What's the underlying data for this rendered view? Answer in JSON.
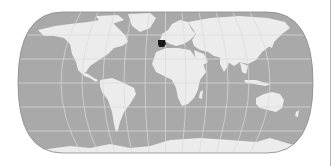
{
  "map": {
    "projection": "pseudocylindrical world map (Eckert-style)",
    "highlighted_region": "Spain",
    "colors": {
      "ocean": "#a9a9a9",
      "land": "#ececec",
      "graticule": "#dadada",
      "outline": "#8a8a8a",
      "highlight": "#1a1a1a",
      "background": "#ffffff"
    },
    "graticule": {
      "meridian_spacing_deg": 30,
      "parallel_spacing_deg": 30
    }
  }
}
